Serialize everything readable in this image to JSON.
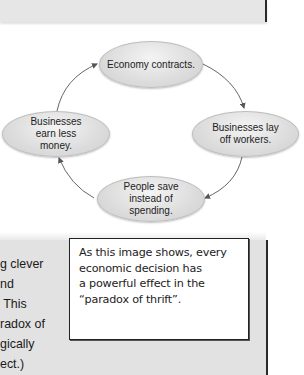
{
  "diagram": {
    "nodes": [
      {
        "id": "top",
        "label": "Economy contracts."
      },
      {
        "id": "right",
        "label": "Businesses lay off workers."
      },
      {
        "id": "bottom",
        "label": "People save instead of spending."
      },
      {
        "id": "left",
        "label": "Businesses earn less money."
      }
    ],
    "edges": [
      {
        "from": "top",
        "to": "right"
      },
      {
        "from": "right",
        "to": "bottom"
      },
      {
        "from": "bottom",
        "to": "left"
      },
      {
        "from": "left",
        "to": "top"
      }
    ],
    "colors": {
      "node_fill": "#dcdcdc",
      "node_border": "#bdbdbd",
      "arrow": "#555555"
    }
  },
  "body_text": {
    "lines": [
      "g clever",
      "nd",
      " This",
      "radox of",
      "gically",
      "ect.)"
    ]
  },
  "callout": {
    "lines": [
      "As this image shows, every",
      "economic decision has",
      "a powerful effect in the",
      "“paradox of thrift”."
    ]
  },
  "panels": {
    "background": "#e2e2e2",
    "border": "#2a2a2a"
  }
}
